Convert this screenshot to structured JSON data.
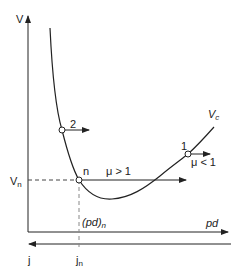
{
  "diagram": {
    "type": "paschen-curve",
    "axes": {
      "y_label": "V",
      "x_label": "pd",
      "bottom_label": "j",
      "y_tick_label": "V",
      "y_tick_sub": "n",
      "x_tick_label": "(pd)",
      "x_tick_sub": "n",
      "bottom_tick_label": "j",
      "bottom_tick_sub": "n"
    },
    "curve_label": "V",
    "curve_label_sub": "c",
    "points": [
      {
        "id": "2",
        "label": "2"
      },
      {
        "id": "n",
        "label": "n"
      },
      {
        "id": "1",
        "label": "1"
      }
    ],
    "annotations": {
      "mu_gt": "μ > 1",
      "mu_lt": "μ < 1"
    },
    "colors": {
      "line": "#222222",
      "dashed": "#555555",
      "background": "#ffffff"
    }
  }
}
